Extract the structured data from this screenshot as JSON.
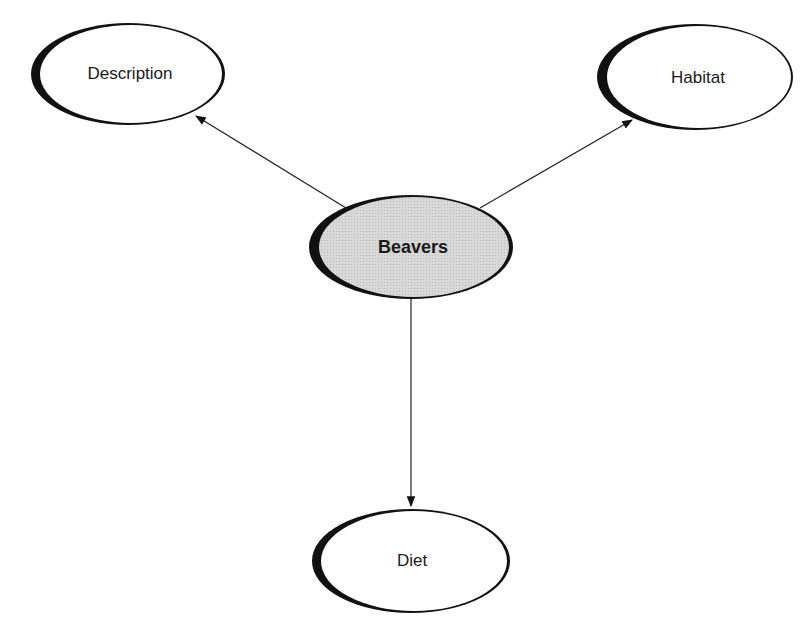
{
  "diagram": {
    "type": "concept-map",
    "center": {
      "id": "beavers",
      "label": "Beavers",
      "fill": "#d6d6d6"
    },
    "nodes": [
      {
        "id": "description",
        "label": "Description"
      },
      {
        "id": "habitat",
        "label": "Habitat"
      },
      {
        "id": "diet",
        "label": "Diet"
      }
    ],
    "edges": [
      {
        "from": "beavers",
        "to": "description"
      },
      {
        "from": "beavers",
        "to": "habitat"
      },
      {
        "from": "beavers",
        "to": "diet"
      }
    ]
  },
  "colors": {
    "outline": "#111111",
    "center_fill": "#d6d6d6",
    "node_fill": "#ffffff"
  }
}
